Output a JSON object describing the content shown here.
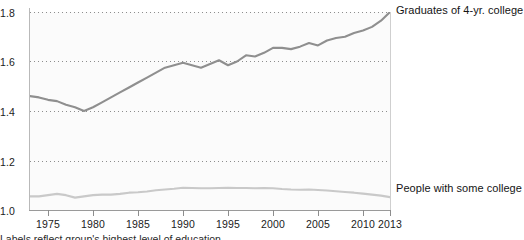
{
  "chart_data": {
    "type": "line",
    "title": "",
    "xlabel": "",
    "ylabel": "",
    "xlim": [
      1973,
      2013
    ],
    "ylim": [
      1.0,
      1.8
    ],
    "grid": "horizontal-dotted",
    "legend_position": "right-of-plot-inline",
    "y_ticks": [
      "1.0",
      "1.2",
      "1.4",
      "1.6",
      "1.8"
    ],
    "y_tick_values": [
      1.0,
      1.2,
      1.4,
      1.6,
      1.8
    ],
    "x_ticks": [
      "1975",
      "1980",
      "1985",
      "1990",
      "1995",
      "2000",
      "2005",
      "2010",
      "2013"
    ],
    "x_tick_values": [
      1975,
      1980,
      1985,
      1990,
      1995,
      2000,
      2005,
      2010,
      2013
    ],
    "x": [
      1973,
      1974,
      1975,
      1976,
      1977,
      1978,
      1979,
      1980,
      1981,
      1982,
      1983,
      1984,
      1985,
      1986,
      1987,
      1988,
      1989,
      1990,
      1991,
      1992,
      1993,
      1994,
      1995,
      1996,
      1997,
      1998,
      1999,
      2000,
      2001,
      2002,
      2003,
      2004,
      2005,
      2006,
      2007,
      2008,
      2009,
      2010,
      2011,
      2012,
      2013
    ],
    "series": [
      {
        "name": "Graduates of 4-yr. college",
        "color": "#8f8f8f",
        "values": [
          1.46,
          1.455,
          1.445,
          1.44,
          1.425,
          1.415,
          1.4,
          1.415,
          1.435,
          1.455,
          1.475,
          1.495,
          1.515,
          1.535,
          1.555,
          1.575,
          1.585,
          1.595,
          1.585,
          1.575,
          1.59,
          1.605,
          1.585,
          1.6,
          1.625,
          1.62,
          1.635,
          1.655,
          1.655,
          1.65,
          1.66,
          1.675,
          1.665,
          1.685,
          1.695,
          1.7,
          1.715,
          1.725,
          1.74,
          1.765,
          1.8
        ]
      },
      {
        "name": "People with some college",
        "color": "#c9c9c9",
        "values": [
          1.055,
          1.055,
          1.06,
          1.065,
          1.06,
          1.05,
          1.055,
          1.06,
          1.062,
          1.062,
          1.065,
          1.07,
          1.072,
          1.075,
          1.08,
          1.083,
          1.086,
          1.09,
          1.089,
          1.088,
          1.088,
          1.089,
          1.09,
          1.089,
          1.089,
          1.088,
          1.089,
          1.088,
          1.085,
          1.083,
          1.082,
          1.083,
          1.081,
          1.079,
          1.076,
          1.073,
          1.07,
          1.066,
          1.062,
          1.058,
          1.052
        ]
      }
    ],
    "annotations": {
      "footnote": "Labels reflect group's highest level of education"
    }
  },
  "labels": {
    "series_top": "Graduates of 4-yr. college",
    "series_bottom": "People with some college"
  }
}
